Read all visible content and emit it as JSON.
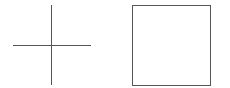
{
  "canvas": {
    "width": 230,
    "height": 88,
    "background": "#ffffff"
  },
  "shapes": [
    {
      "type": "cross",
      "stroke": "#555555",
      "vertical": {
        "x": 51,
        "y1": 5,
        "y2": 85
      },
      "horizontal": {
        "y": 45,
        "x1": 13,
        "x2": 91
      }
    },
    {
      "type": "square",
      "stroke": "#555555",
      "x": 132,
      "y": 5,
      "width": 79,
      "height": 81
    }
  ]
}
